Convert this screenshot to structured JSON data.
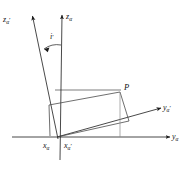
{
  "figure": {
    "type": "vector-geometry-diagram",
    "background_color": "#ffffff",
    "line_color": "#1a1a1a",
    "faint_line_color": "#9a9a9a"
  },
  "labels": {
    "z_alpha_prime": {
      "base": "z",
      "sub": "α",
      "prime": "′"
    },
    "z_alpha": {
      "base": "z",
      "sub": "α",
      "prime": ""
    },
    "y_alpha_prime": {
      "base": "y",
      "sub": "α",
      "prime": "′"
    },
    "y_alpha": {
      "base": "y",
      "sub": "α",
      "prime": ""
    },
    "x_alpha": {
      "base": "x",
      "sub": "α",
      "prime": ""
    },
    "x_alpha_prime": {
      "base": "x",
      "sub": "α",
      "prime": "′"
    },
    "angle": {
      "base": "i",
      "sub": "",
      "prime": "′"
    },
    "point_p": {
      "base": "P",
      "sub": "",
      "prime": ""
    }
  },
  "geometry": {
    "origin": {
      "x": 57,
      "y": 137
    },
    "axes": [
      {
        "name": "z-alpha-axis",
        "from": [
          57,
          137
        ],
        "to": [
          62,
          13
        ],
        "arrow": true
      },
      {
        "name": "z-alpha-prime-axis",
        "from": [
          57,
          137
        ],
        "to": [
          32,
          14
        ],
        "arrow": true
      },
      {
        "name": "y-alpha-axis",
        "from": [
          12,
          137
        ],
        "to": [
          172,
          137
        ],
        "arrow": true
      },
      {
        "name": "y-alpha-prime-axis",
        "from": [
          57,
          137
        ],
        "to": [
          163,
          108
        ],
        "arrow": true
      }
    ],
    "point_p": {
      "x": 120,
      "y": 92
    },
    "projection_box": [
      [
        49,
        105
      ],
      [
        120,
        92
      ],
      [
        120,
        125
      ],
      [
        49,
        137
      ]
    ],
    "faint_top_line": {
      "from": [
        55,
        90
      ],
      "to": [
        120,
        90
      ]
    },
    "drop_line": {
      "from": [
        120,
        92
      ],
      "to": [
        129,
        120
      ]
    },
    "vertical_drop": {
      "from": [
        120,
        92
      ],
      "to": [
        120,
        137
      ]
    },
    "angle_arc": {
      "center": [
        57,
        137
      ],
      "label_at": [
        49,
        37
      ]
    }
  }
}
